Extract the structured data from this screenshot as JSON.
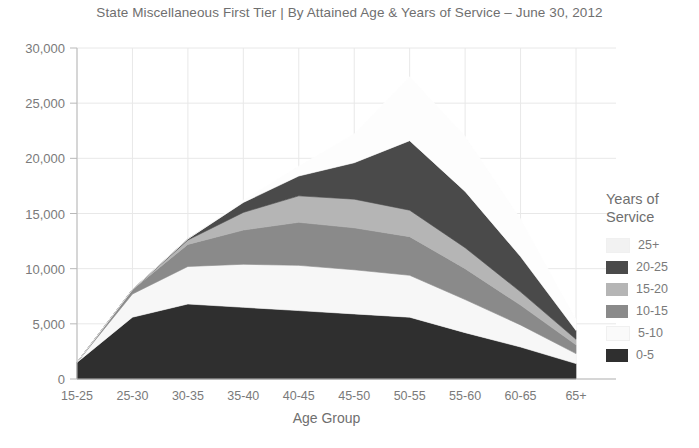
{
  "chart_data": {
    "type": "area",
    "title": "State Miscellaneous First Tier | By Attained Age & Years of Service – June 30, 2012",
    "xlabel": "Age Group",
    "ylabel": "",
    "stacked": true,
    "grid": true,
    "legend_position": "right",
    "legend_title": "Years of\nService",
    "categories": [
      "15-25",
      "25-30",
      "30-35",
      "35-40",
      "40-45",
      "45-50",
      "50-55",
      "55-60",
      "60-65",
      "65+"
    ],
    "ylim": [
      0,
      30000
    ],
    "yticks": [
      0,
      5000,
      10000,
      15000,
      20000,
      25000,
      30000
    ],
    "ytick_labels": [
      "0",
      "5,000",
      "10,000",
      "15,000",
      "20,000",
      "25,000",
      "30,000"
    ],
    "series": [
      {
        "name": "0-5",
        "color": "#2f2f2f",
        "values": [
          1500,
          5600,
          6800,
          6500,
          6200,
          5900,
          5600,
          4200,
          2900,
          1400
        ]
      },
      {
        "name": "5-10",
        "color": "#f7f7f7",
        "values": [
          0,
          2100,
          3400,
          3900,
          4100,
          4000,
          3800,
          3000,
          2000,
          900
        ]
      },
      {
        "name": "10-15",
        "color": "#8a8a8a",
        "values": [
          0,
          400,
          2000,
          3100,
          3900,
          3800,
          3500,
          2800,
          1800,
          800
        ]
      },
      {
        "name": "15-20",
        "color": "#b5b5b5",
        "values": [
          0,
          0,
          400,
          1600,
          2400,
          2600,
          2400,
          1900,
          1200,
          500
        ]
      },
      {
        "name": "20-25",
        "color": "#4a4a4a",
        "values": [
          0,
          0,
          100,
          900,
          1800,
          3300,
          6300,
          5100,
          3200,
          800
        ]
      },
      {
        "name": "25+",
        "color": "#fdfdfd",
        "values": [
          0,
          0,
          0,
          200,
          900,
          2600,
          5800,
          5000,
          3400,
          1000
        ]
      }
    ],
    "legend_entries": [
      {
        "label": "25+",
        "color": "#f2f2f2"
      },
      {
        "label": "20-25",
        "color": "#4a4a4a"
      },
      {
        "label": "15-20",
        "color": "#b5b5b5"
      },
      {
        "label": "10-15",
        "color": "#8a8a8a"
      },
      {
        "label": "5-10",
        "color": "#fafafa"
      },
      {
        "label": "0-5",
        "color": "#2f2f2f"
      }
    ]
  },
  "colors": {
    "axis": "#b9b9b9",
    "grid": "#e8e8e8",
    "text": "#7a7a7a",
    "title": "#6f6f6f",
    "background": "#ffffff"
  }
}
